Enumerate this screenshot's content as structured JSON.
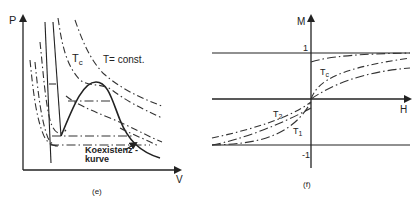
{
  "panel_e": {
    "y_axis_label": "P",
    "x_axis_label": "V",
    "critical_temp_label": "T",
    "critical_temp_sub": "c",
    "isotherm_label": "T= const.",
    "coexistence_label_line1": "Koexistenz -",
    "coexistence_label_line2": "kurve",
    "caption": "(e)"
  },
  "panel_f": {
    "y_axis_label": "M",
    "x_axis_label": "H",
    "tick_plus_one": "1",
    "tick_minus_one": "-1",
    "curve_labels": [
      {
        "main": "T",
        "sub": "c"
      },
      {
        "main": "T",
        "sub": "2"
      },
      {
        "main": "T",
        "sub": "1"
      }
    ],
    "caption": "(f)"
  }
}
